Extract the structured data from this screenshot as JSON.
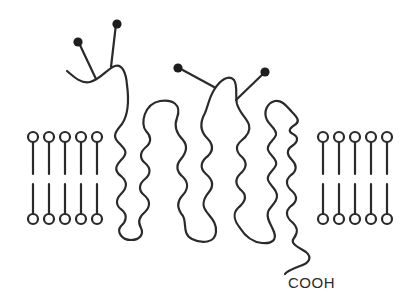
{
  "diagram": {
    "terminus_label": "COOH",
    "stroke_color": "#2a2a2a",
    "background": "#ffffff",
    "lipids_left_count": 5,
    "lipids_right_count": 5,
    "glycosylation_sites": 4,
    "transmembrane_helices": 7
  }
}
